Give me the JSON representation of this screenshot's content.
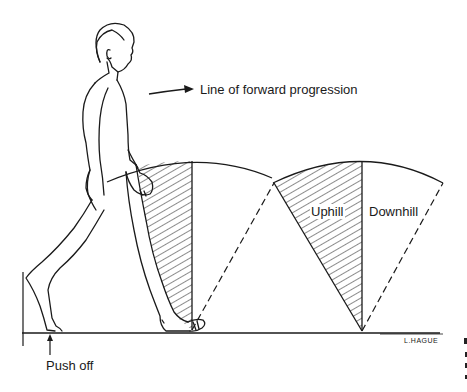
{
  "diagram": {
    "labels": {
      "progression": "Line of forward progression",
      "uphill": "Uphill",
      "downhill": "Downhill",
      "push_off": "Push off",
      "signature": "L.HAGUE"
    },
    "elements": [
      {
        "name": "walking-figure",
        "type": "line-drawing"
      },
      {
        "name": "progression-arrow",
        "type": "arrow",
        "direction": "right"
      },
      {
        "name": "pendulum-sector-1",
        "pivot_x": 192,
        "hatched_side": "left"
      },
      {
        "name": "pendulum-sector-2",
        "pivot_x": 362,
        "hatched_side": "left"
      },
      {
        "name": "ground-line",
        "y": 333
      },
      {
        "name": "push-off-arrow",
        "type": "arrow",
        "direction": "up"
      }
    ],
    "colors": {
      "line": "#1a1a1a",
      "background": "#ffffff"
    }
  }
}
